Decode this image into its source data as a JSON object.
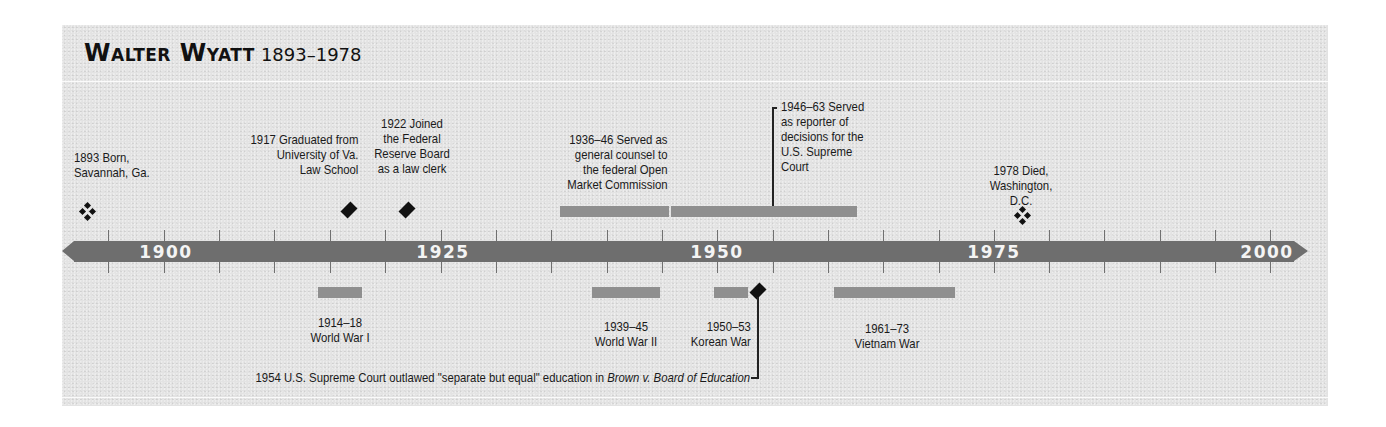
{
  "title": {
    "name": "Walter Wyatt",
    "dates": "1893–1978"
  },
  "axis": {
    "start_year": 1893,
    "end_year": 2000,
    "labels": [
      "1900",
      "1925",
      "1950",
      "1975",
      "2000"
    ],
    "tick_interval_years": 5
  },
  "colors": {
    "background": "#e3e3e3",
    "axis_bar": "#6e6e6e",
    "period_bar": "#8f8f8f",
    "axis_label": "#f4f4f4",
    "text": "#1a1a1a"
  },
  "life_events": [
    {
      "year": "1893",
      "marker": "quad-diamond-icon",
      "lines": [
        "1893 Born,",
        "Savannah, Ga."
      ]
    },
    {
      "year": "1917",
      "marker": "diamond-icon",
      "lines": [
        "1917 Graduated from",
        "University of Va.",
        "Law School"
      ]
    },
    {
      "year": "1922",
      "marker": "diamond-icon",
      "lines": [
        "1922 Joined",
        "the Federal",
        "Reserve Board",
        "as a law clerk"
      ]
    },
    {
      "year": "1936–46",
      "marker": "period-bar",
      "lines": [
        "1936–46 Served as",
        "general counsel to",
        "the federal Open",
        "Market Commission"
      ]
    },
    {
      "year": "1946–63",
      "marker": "period-bar",
      "lines": [
        "1946–63 Served",
        "as reporter of",
        "decisions for the",
        "U.S. Supreme",
        "Court"
      ]
    },
    {
      "year": "1978",
      "marker": "quad-diamond-icon",
      "lines": [
        "1978 Died,",
        "Washington,",
        "D.C."
      ]
    }
  ],
  "world_events": [
    {
      "years": "1914–18",
      "name": "World War I"
    },
    {
      "years": "1939–45",
      "name": "World War II"
    },
    {
      "years": "1950–53",
      "name": "Korean War"
    },
    {
      "years": "1961–73",
      "name": "Vietnam War"
    }
  ],
  "footnote_event": {
    "year": "1954",
    "text": "1954 U.S. Supreme Court outlawed \"separate but equal\" education in ",
    "case": "Brown v. Board of Education"
  }
}
